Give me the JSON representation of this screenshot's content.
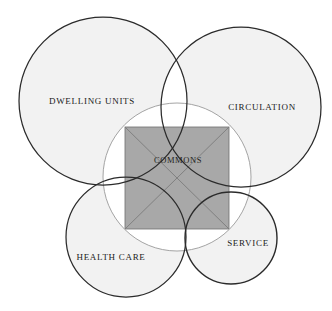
{
  "diagram": {
    "type": "venn-overlap-diagram",
    "title": "Commons",
    "background_color": "#ffffff",
    "circle_fill": "#f0f0f0",
    "circle_fill_opacity": 0.55,
    "circle_stroke_dark": "#2b2b2b",
    "circle_stroke_light": "#8d8d8d",
    "square_fill": "#a8a8a8",
    "square_stroke": "#6e6e6e",
    "diagonal_stroke": "#7a7a7a",
    "circles": [
      {
        "id": "dwelling-units",
        "label": "DWELLING UNITS",
        "cx": 103,
        "cy": 101,
        "r": 84,
        "stroke": "#2b2b2b",
        "stroke_width": 1.3,
        "label_x": 92,
        "label_y": 102
      },
      {
        "id": "circulation",
        "label": "CIRCULATION",
        "cx": 241,
        "cy": 107,
        "r": 80,
        "stroke": "#2b2b2b",
        "stroke_width": 1.3,
        "label_x": 262,
        "label_y": 108
      },
      {
        "id": "health-care",
        "label": "HEALTH CARE",
        "cx": 126,
        "cy": 237,
        "r": 60,
        "stroke": "#2b2b2b",
        "stroke_width": 1.3,
        "label_x": 111,
        "label_y": 258
      },
      {
        "id": "service",
        "label": "SERVICE",
        "cx": 231,
        "cy": 238,
        "r": 46,
        "stroke": "#2b2b2b",
        "stroke_width": 1.3,
        "label_x": 248,
        "label_y": 244
      }
    ],
    "inner_circle": {
      "id": "commons-circumscribing-circle",
      "cx": 177,
      "cy": 177,
      "r": 74,
      "stroke": "#9a9a9a",
      "stroke_width": 0.9
    },
    "commons_square": {
      "id": "commons-square",
      "label": "COMMONS",
      "x": 125,
      "y": 127,
      "width": 104,
      "height": 102,
      "label_x": 178,
      "label_y": 161,
      "fill": "#a8a8a8",
      "has_diagonals": true
    }
  }
}
